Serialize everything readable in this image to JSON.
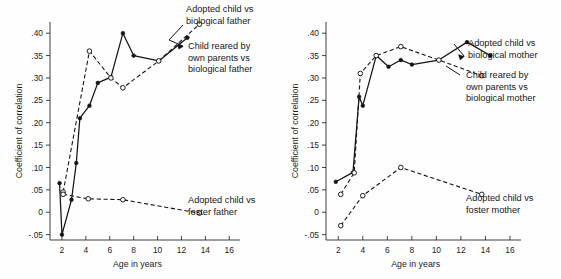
{
  "figure": {
    "background": "#fefefe",
    "ink": "#141414",
    "width": 561,
    "height": 279
  },
  "chart_data": [
    {
      "id": "fathers",
      "type": "line",
      "title": "",
      "xlabel": "Age in years",
      "ylabel": "Coefficient of correlation",
      "xlim": [
        1.0,
        16.9
      ],
      "ylim": [
        -0.062,
        0.425
      ],
      "xticks": [
        2,
        4,
        6,
        8,
        10,
        12,
        14,
        16
      ],
      "xticklabels": [
        "2",
        "4",
        "6",
        "8",
        "10",
        "12",
        "14",
        "16"
      ],
      "yticks": [
        -0.05,
        0,
        0.05,
        0.1,
        0.15,
        0.2,
        0.25,
        0.3,
        0.35,
        0.4
      ],
      "yticklabels": [
        "-.05",
        "0",
        ".05",
        ".10",
        ".15",
        ".20",
        ".25",
        ".30",
        ".35",
        ".40"
      ],
      "grid": false,
      "legend_position": "inline-annotations",
      "series": [
        {
          "name": "Child reared by own parents vs biological father",
          "style": "solid",
          "marker": "filled-circle",
          "x": [
            1.8,
            2.0,
            2.8,
            3.2,
            3.5,
            4.3,
            5.0,
            6.1,
            7.1,
            8.0,
            10.1,
            12.5
          ],
          "values": [
            0.065,
            -0.05,
            0.028,
            0.11,
            0.21,
            0.238,
            0.289,
            0.302,
            0.4,
            0.35,
            0.338,
            0.39
          ]
        },
        {
          "name": "Adopted child vs biological father",
          "style": "dashed",
          "marker": "open-circle",
          "x": [
            2.1,
            4.3,
            6.1,
            7.1,
            10.1,
            13.5
          ],
          "values": [
            0.045,
            0.36,
            0.3,
            0.278,
            0.338,
            0.42
          ]
        },
        {
          "name": "Adopted child vs foster father",
          "style": "dashed",
          "marker": "open-circle",
          "x": [
            2.1,
            4.2,
            7.1,
            13.5
          ],
          "values": [
            0.04,
            0.03,
            0.028,
            -0.002
          ]
        }
      ],
      "annotations": [
        {
          "label": "Adopted child vs\nbiological father",
          "target_series": "Adopted child vs biological father",
          "target_point": [
            13.5,
            0.42
          ]
        },
        {
          "label": "Child reared by\nown parents vs\nbiological father",
          "target_series": "Child reared by own parents vs biological father",
          "target_point": [
            12.5,
            0.39
          ]
        },
        {
          "label": "Adopted child vs\nfoster father",
          "target_series": "Adopted child vs foster father",
          "target_point": [
            13.5,
            -0.002
          ]
        }
      ]
    },
    {
      "id": "mothers",
      "type": "line",
      "title": "",
      "xlabel": "Age in years",
      "ylabel": "Coefficient of correlation",
      "xlim": [
        1.0,
        16.9
      ],
      "ylim": [
        -0.062,
        0.425
      ],
      "xticks": [
        2,
        4,
        6,
        8,
        10,
        12,
        14,
        16
      ],
      "xticklabels": [
        "2",
        "4",
        "6",
        "8",
        "10",
        "12",
        "14",
        "16"
      ],
      "yticks": [
        -0.05,
        0,
        0.05,
        0.1,
        0.15,
        0.2,
        0.25,
        0.3,
        0.35,
        0.4
      ],
      "yticklabels": [
        "-.05",
        "0",
        ".05",
        ".10",
        ".15",
        ".20",
        ".25",
        ".30",
        ".35",
        ".40"
      ],
      "grid": false,
      "legend_position": "inline-annotations",
      "series": [
        {
          "name": "Adopted child vs biological mother",
          "style": "solid",
          "marker": "filled-circle",
          "x": [
            1.8,
            3.2,
            3.7,
            4.0,
            5.1,
            6.1,
            7.1,
            8.0,
            10.2,
            12.5,
            14.4
          ],
          "values": [
            0.068,
            0.089,
            0.258,
            0.238,
            0.35,
            0.325,
            0.34,
            0.33,
            0.34,
            0.38,
            0.35
          ]
        },
        {
          "name": "Child reared by own parents vs biological mother",
          "style": "dashed",
          "marker": "open-circle",
          "x": [
            2.2,
            3.3,
            3.8,
            5.1,
            7.1,
            10.2,
            13.7
          ],
          "values": [
            0.04,
            0.088,
            0.31,
            0.35,
            0.37,
            0.34,
            0.305
          ]
        },
        {
          "name": "Adopted child vs foster mother",
          "style": "dashed",
          "marker": "open-circle",
          "x": [
            2.2,
            4.0,
            7.1,
            13.7
          ],
          "values": [
            -0.03,
            0.037,
            0.1,
            0.04
          ]
        }
      ],
      "annotations": [
        {
          "label": "Adopted child vs\nbiological mother",
          "target_series": "Adopted child vs biological mother",
          "target_point": [
            12.5,
            0.38
          ]
        },
        {
          "label": "Child reared by\nown parents vs\nbiological mother",
          "target_series": "Child reared by own parents vs biological mother",
          "target_point": [
            13.7,
            0.305
          ]
        },
        {
          "label": "Adopted child vs\nfoster mother",
          "target_series": "Adopted child vs foster mother",
          "target_point": [
            13.7,
            0.04
          ]
        }
      ]
    }
  ],
  "left_panel": {
    "ylabel": "Coefficient of correlation",
    "xlabel": "Age in years",
    "yticklabels": [
      "-.05",
      "0",
      ".05",
      ".10",
      ".15",
      ".20",
      ".25",
      ".30",
      ".35",
      ".40"
    ],
    "xticklabels": [
      "2",
      "4",
      "6",
      "8",
      "10",
      "12",
      "14",
      "16"
    ],
    "annot1_line1": "Adopted child vs",
    "annot1_line2": "biological father",
    "annot2_line1": "Child reared by",
    "annot2_line2": "own parents vs",
    "annot2_line3": "biological father",
    "annot3_line1": "Adopted child vs",
    "annot3_line2": "foster father"
  },
  "right_panel": {
    "ylabel": "Coefficient of correlation",
    "xlabel": "Age in years",
    "yticklabels": [
      "-.05",
      "0",
      ".05",
      ".10",
      ".15",
      ".20",
      ".25",
      ".30",
      ".35",
      ".40"
    ],
    "xticklabels": [
      "2",
      "4",
      "6",
      "8",
      "10",
      "12",
      "14",
      "16"
    ],
    "annot1_line1": "Adopted child vs",
    "annot1_line2": "biological mother",
    "annot2_line1": "Child reared by",
    "annot2_line2": "own parents vs",
    "annot2_line3": "biological mother",
    "annot3_line1": "Adopted child vs",
    "annot3_line2": "foster mother"
  }
}
